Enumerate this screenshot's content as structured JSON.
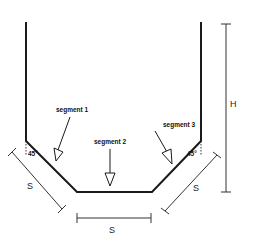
{
  "diagram": {
    "type": "hopper cross-section with chamfered bottom",
    "labels": {
      "segment1": "segment 1",
      "segment2": "segment 2",
      "segment3": "segment 3",
      "angle_left": "45°",
      "angle_right": "45°",
      "dim_s_left": "S",
      "dim_s_bottom": "S",
      "dim_s_right": "S",
      "dim_h": "H"
    },
    "colors": {
      "outline": "#1a1a1a",
      "dimension": "#333333",
      "background": "#ffffff"
    }
  }
}
